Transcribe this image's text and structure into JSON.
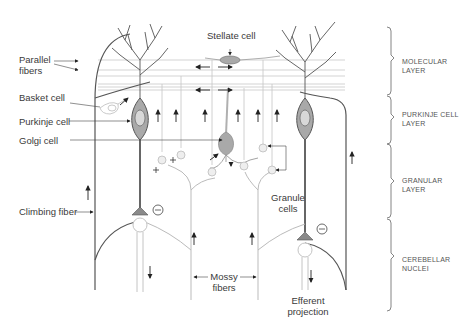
{
  "diagram": {
    "labels": {
      "parallel_fibers": "Parallel fibers",
      "parallel_fibers_line1": "Parallel",
      "parallel_fibers_line2": "fibers",
      "basket_cell": "Basket cell",
      "purkinje_cell": "Purkinje cell",
      "golgi_cell": "Golgi cell",
      "climbing_fiber": "Climbing fiber",
      "stellate_cell": "Stellate cell",
      "granule_cells_line1": "Granule",
      "granule_cells_line2": "cells",
      "mossy_fibers_line1": "Mossy",
      "mossy_fibers_line2": "fibers",
      "efferent_line1": "Efferent",
      "efferent_line2": "projection"
    },
    "layers": [
      {
        "line1": "MOLECULAR",
        "line2": "LAYER"
      },
      {
        "line1": "PURKINJE CELL",
        "line2": "LAYER"
      },
      {
        "line1": "GRANULAR",
        "line2": "LAYER"
      },
      {
        "line1": "CEREBELLAR",
        "line2": "NUCLEI"
      }
    ],
    "symbols": {
      "inhibitory": "−",
      "excitatory": "+"
    },
    "colors": {
      "line_dark": "#3a3a3a",
      "line_mid": "#8a8a8a",
      "line_light": "#c4c4c4",
      "cell_fill": "#a9a9a9",
      "nucleus_fill": "#d8d8d8"
    }
  }
}
